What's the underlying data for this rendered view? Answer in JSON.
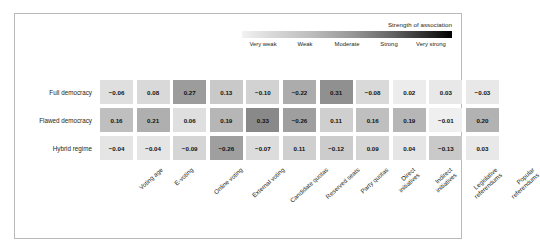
{
  "legend": {
    "title": "Strength of association",
    "ticks": [
      "Very weak",
      "Weak",
      "Moderate",
      "Strong",
      "Very strong"
    ],
    "gradient_from": "#f2f2f2",
    "gradient_to": "#000000"
  },
  "chart_data": {
    "type": "heatmap",
    "title": "",
    "xlabel": "",
    "ylabel": "",
    "legend_title": "Strength of association",
    "legend_position": "top-right",
    "grid": false,
    "value_scale": "absolute value of coefficient maps to darkness",
    "categories": [
      "Voting age",
      "E-voting",
      "Online voting",
      "External voting",
      "Candidate quotas",
      "Reserved seats",
      "Party quotas",
      "Direct initiatives",
      "Indirect initiatives",
      "Legislative referendums",
      "Popular referendums"
    ],
    "rows": [
      "Full democracy",
      "Flawed democracy",
      "Hybrid regime"
    ],
    "series": [
      {
        "name": "Full democracy",
        "values": [
          -0.06,
          0.08,
          0.27,
          0.13,
          -0.1,
          -0.22,
          0.31,
          -0.08,
          0.02,
          0.03,
          -0.03
        ],
        "labels": [
          "−0.06",
          "0.08",
          "0.27",
          "0.13",
          "−0.10",
          "−0.22",
          "0.31",
          "−0.08",
          "0.02",
          "0.03",
          "−0.03"
        ]
      },
      {
        "name": "Flawed democracy",
        "values": [
          0.16,
          0.21,
          0.06,
          0.19,
          0.33,
          -0.26,
          0.11,
          0.16,
          0.19,
          -0.01,
          0.2
        ],
        "labels": [
          "0.16",
          "0.21",
          "0.06",
          "0.19",
          "0.33",
          "−0.26",
          "0.11",
          "0.16",
          "0.19",
          "−0.01",
          "0.20"
        ]
      },
      {
        "name": "Hybrid regime",
        "values": [
          -0.04,
          -0.04,
          -0.09,
          -0.26,
          -0.07,
          0.11,
          -0.12,
          0.09,
          0.04,
          -0.13,
          0.03
        ],
        "labels": [
          "−0.04",
          "−0.04",
          "−0.09",
          "−0.26",
          "−0.07",
          "0.11",
          "−0.12",
          "0.09",
          "0.04",
          "−0.13",
          "0.03"
        ]
      }
    ]
  }
}
